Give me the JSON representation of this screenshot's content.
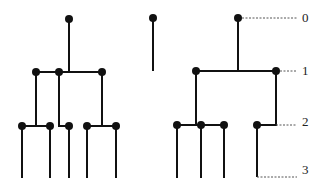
{
  "diagram": {
    "type": "tree-levels",
    "depth_labels": [
      {
        "text": "0",
        "y": 18
      },
      {
        "text": "1",
        "y": 71
      },
      {
        "text": "2",
        "y": 125
      },
      {
        "text": "3",
        "y": 177
      }
    ],
    "colors": {
      "stroke": "#111111",
      "dash": "#555555",
      "background": "#ffffff"
    }
  }
}
